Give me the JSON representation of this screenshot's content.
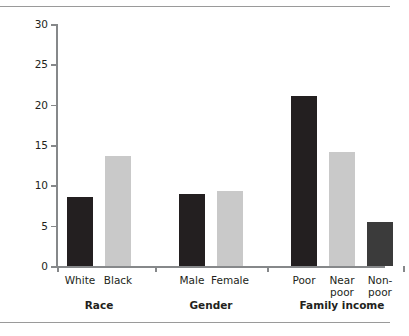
{
  "chart_data": {
    "type": "bar",
    "title": "",
    "subtitle": "",
    "xlabel": "",
    "ylabel": "Percentage",
    "ylim": [
      0,
      30
    ],
    "yticks": [
      0,
      5,
      10,
      15,
      20,
      25,
      30
    ],
    "ytick_labels": [
      "0",
      "5",
      "10",
      "15",
      "20",
      "25",
      "30"
    ],
    "grid": false,
    "legend": "none",
    "categories": [
      "White",
      "Black",
      "Male",
      "Female",
      "Poor",
      "Near poor",
      "Non-poor"
    ],
    "values": [
      8.6,
      13.6,
      8.9,
      9.3,
      21.1,
      14.1,
      5.4
    ],
    "groups": [
      {
        "name": "Race",
        "bars": [
          {
            "label": "White",
            "label_lines": [
              "White"
            ],
            "value": 8.6,
            "color": "#231f20"
          },
          {
            "label": "Black",
            "label_lines": [
              "Black"
            ],
            "value": 13.6,
            "color": "#c9c9c9"
          }
        ]
      },
      {
        "name": "Gender",
        "bars": [
          {
            "label": "Male",
            "label_lines": [
              "Male"
            ],
            "value": 8.9,
            "color": "#231f20"
          },
          {
            "label": "Female",
            "label_lines": [
              "Female"
            ],
            "value": 9.3,
            "color": "#c9c9c9"
          }
        ]
      },
      {
        "name": "Family income",
        "bars": [
          {
            "label": "Poor",
            "label_lines": [
              "Poor"
            ],
            "value": 21.1,
            "color": "#231f20"
          },
          {
            "label": "Near poor",
            "label_lines": [
              "Near",
              "poor"
            ],
            "value": 14.1,
            "color": "#c9c9c9"
          },
          {
            "label": "Non-poor",
            "label_lines": [
              "Non-",
              "poor"
            ],
            "value": 5.4,
            "color": "#3b3b3b"
          }
        ]
      }
    ],
    "colors": {
      "dark_bar": "#231f20",
      "light_bar": "#c9c9c9",
      "medium_bar": "#3b3b3b",
      "axis": "#86888a",
      "rule": "#9a9a9a",
      "background": "#ffffff",
      "text": "#231f20"
    }
  },
  "axis": {
    "y_title": "Percentage"
  }
}
